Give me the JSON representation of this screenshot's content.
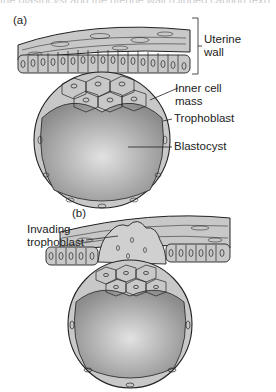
{
  "header_fragment": "the blastocyst and the uterine wall (clipped caption text)",
  "panels": {
    "a": {
      "label": "(a)",
      "annotations": {
        "uterine_wall": [
          "Uterine",
          "wall"
        ],
        "inner_cell_mass": [
          "Inner cell",
          "mass"
        ],
        "trophoblast": "Trophoblast",
        "blastocyst": "Blastocyst"
      }
    },
    "b": {
      "label": "(b)",
      "annotations": {
        "invading_trophoblast": [
          "Invading",
          "trophoblast"
        ]
      }
    }
  },
  "colors": {
    "tissue_fill": "#c8c8c8",
    "outline": "#222222",
    "cavity_stipple": "#9a9a9a",
    "background": "#ffffff"
  }
}
